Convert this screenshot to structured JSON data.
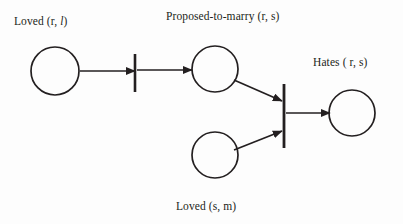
{
  "diagram": {
    "type": "petri-net",
    "title": "",
    "background_color": "#fdfdfd",
    "stroke_color": "#231f20",
    "labels": {
      "loved_rl_prefix": "Loved (r, ",
      "loved_rl_italic": "l",
      "loved_rl_suffix": ")",
      "loved_rl_full": "Loved (r, l)",
      "proposed_to_marry": "Proposed-to-marry (r, s)",
      "hates": "Hates ( r, s)",
      "loved_sm": "Loved (s, m)"
    },
    "places": [
      {
        "id": "p-loved-rl",
        "name": "place-loved-rl",
        "label_ref": "loved_rl_full",
        "cx": 55,
        "cy": 71,
        "r": 24
      },
      {
        "id": "p-proposed",
        "name": "place-proposed-to-marry",
        "label_ref": "proposed_to_marry",
        "cx": 215,
        "cy": 69,
        "r": 23
      },
      {
        "id": "p-loved-sm",
        "name": "place-loved-sm",
        "label_ref": "loved_sm",
        "cx": 215,
        "cy": 155,
        "r": 23
      },
      {
        "id": "p-hates",
        "name": "place-hates",
        "label_ref": "hates",
        "cx": 352,
        "cy": 113,
        "r": 23
      }
    ],
    "transitions": [
      {
        "id": "t1",
        "name": "transition-bar-left",
        "x": 135,
        "y1": 54,
        "y2": 92
      },
      {
        "id": "t2",
        "name": "transition-bar-center",
        "x": 284,
        "y1": 84,
        "y2": 148
      }
    ],
    "arcs": [
      {
        "id": "a1",
        "name": "arc-loved-rl-to-t1",
        "from": "p-loved-rl",
        "to": "t1",
        "x1": 80,
        "y1": 71,
        "x2": 135,
        "y2": 71,
        "arrow": true
      },
      {
        "id": "a2",
        "name": "arc-t1-to-proposed",
        "from": "t1",
        "to": "p-proposed",
        "x1": 137,
        "y1": 70,
        "x2": 192,
        "y2": 70,
        "arrow": true
      },
      {
        "id": "a3",
        "name": "arc-proposed-to-t2",
        "from": "p-proposed",
        "to": "t2",
        "x1": 234,
        "y1": 80,
        "x2": 282,
        "y2": 101,
        "arrow": true
      },
      {
        "id": "a4",
        "name": "arc-loved-sm-to-t2",
        "from": "p-loved-sm",
        "to": "t2",
        "x1": 234,
        "y1": 150,
        "x2": 282,
        "y2": 131,
        "arrow": true
      },
      {
        "id": "a5",
        "name": "arc-t2-to-hates",
        "from": "t2",
        "to": "p-hates",
        "x1": 286,
        "y1": 113,
        "x2": 330,
        "y2": 113,
        "arrow": true
      }
    ]
  }
}
